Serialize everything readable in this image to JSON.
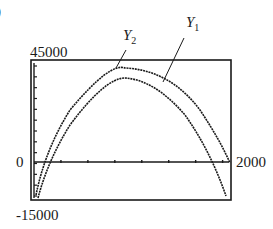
{
  "panel_label_fragment": ")",
  "chart_data": {
    "type": "line",
    "title": "",
    "xlabel": "",
    "ylabel": "",
    "xlim": [
      0,
      2000
    ],
    "ylim": [
      -15000,
      45000
    ],
    "x_tick_labels": {
      "right": "2000"
    },
    "y_tick_labels": {
      "top": "45000",
      "zero": "0",
      "bottom": "-15000"
    },
    "grid": false,
    "x_ticks_count": 7,
    "y_ticks_count": 13,
    "series": [
      {
        "name": "Y1",
        "label_main": "Y",
        "label_sub": "1",
        "points": [
          [
            140,
            0
          ],
          [
            500,
            26000
          ],
          [
            1000,
            36500
          ],
          [
            1500,
            24500
          ],
          [
            1870,
            0
          ],
          [
            1980,
            -10000
          ]
        ]
      },
      {
        "name": "Y2",
        "label_main": "Y",
        "label_sub": "2",
        "points": [
          [
            0,
            -13000
          ],
          [
            60,
            0
          ],
          [
            500,
            30000
          ],
          [
            950,
            40000
          ],
          [
            1500,
            28000
          ],
          [
            1930,
            0
          ]
        ]
      }
    ],
    "legend": "callout labels above curves"
  },
  "colors": {
    "line": "#1a1a1a",
    "background": "#ffffff"
  }
}
